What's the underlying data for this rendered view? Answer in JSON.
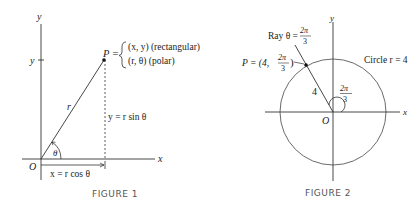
{
  "figure1": {
    "caption": "FIGURE 1",
    "axis_x_label": "x",
    "axis_y_label": "y",
    "y_tick_label": "y",
    "origin_label": "O",
    "point_label": "P =",
    "rect_label": "(x, y) (rectangular)",
    "polar_label": "(r, θ) (polar)",
    "radius_label": "r",
    "angle_label": "θ",
    "vertical_label": "y = r sin θ",
    "horizontal_label": "x = r cos θ"
  },
  "figure2": {
    "caption": "FIGURE 2",
    "axis_x_label": "x",
    "axis_y_label": "y",
    "origin_label": "O",
    "ray_label": "Ray θ =",
    "ray_frac_num": "2π",
    "ray_frac_den": "3",
    "point_label": "P = (4,",
    "point_frac_num": "2π",
    "point_frac_den": "3",
    "point_close": ")",
    "radius_label": "4",
    "angle_frac_num": "2π",
    "angle_frac_den": "3",
    "circle_label": "Circle r = 4"
  }
}
